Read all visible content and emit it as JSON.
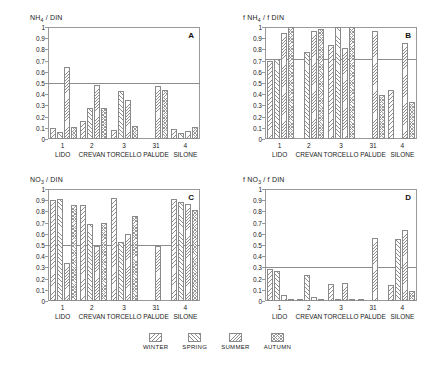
{
  "figure": {
    "width": 434,
    "height": 370,
    "background": "#ffffff",
    "line_color": "#8c8c8c"
  },
  "legend": {
    "position": "bottom-center",
    "items": [
      {
        "label": "WINTER",
        "pattern": "p-winter",
        "swatch_name": "winter-swatch"
      },
      {
        "label": "SPRING",
        "pattern": "p-spring",
        "swatch_name": "spring-swatch"
      },
      {
        "label": "SUMMER",
        "pattern": "p-summer",
        "swatch_name": "summer-swatch"
      },
      {
        "label": "AUTUMN",
        "pattern": "p-autumn",
        "swatch_name": "autumn-swatch"
      }
    ]
  },
  "stations": [
    {
      "num": "1",
      "name": "LIDO"
    },
    {
      "num": "2",
      "name": "CREVAN"
    },
    {
      "num": "3",
      "name": "TORCELLO"
    },
    {
      "num": "31",
      "name": "PALUDE"
    },
    {
      "num": "4",
      "name": "SILONE"
    }
  ],
  "yticks": [
    "1",
    "0.9",
    "0.8",
    "0.7",
    "0.6",
    "0.5",
    "0.4",
    "0.3",
    "0.2",
    "0.1",
    "0"
  ],
  "chart_data": [
    {
      "id": "A",
      "type": "bar",
      "title": "NH4 / DIN",
      "title_main": "NH",
      "title_sub": "4",
      "title_tail": " / DIN",
      "panel_letter": "A",
      "xlabel": "",
      "ylabel": "NH4 / DIN",
      "ylim": [
        0,
        1
      ],
      "ytick_step": 0.1,
      "grid": false,
      "threshold": 0.5,
      "categories": [
        "1 LIDO",
        "2 CREVAN",
        "3 TORCELLO",
        "31 PALUDE",
        "4 SILONE"
      ],
      "series": [
        {
          "name": "WINTER",
          "values": [
            0.1,
            0.16,
            0.08,
            null,
            0.09
          ]
        },
        {
          "name": "SPRING",
          "values": [
            0.06,
            0.28,
            0.43,
            null,
            0.05
          ]
        },
        {
          "name": "SUMMER",
          "values": [
            0.64,
            0.48,
            0.35,
            0.47,
            0.07
          ]
        },
        {
          "name": "AUTUMN",
          "values": [
            0.11,
            0.28,
            0.12,
            0.44,
            0.11
          ]
        }
      ]
    },
    {
      "id": "B",
      "type": "bar",
      "title": "f NH4 / f DIN",
      "title_main": "f NH",
      "title_sub": "4",
      "title_tail": " / f DIN",
      "panel_letter": "B",
      "xlabel": "",
      "ylabel": "f NH4 / f DIN",
      "ylim": [
        0,
        1
      ],
      "ytick_step": 0.1,
      "grid": false,
      "threshold": 0.71,
      "categories": [
        "1 LIDO",
        "2 CREVAN",
        "3 TORCELLO",
        "31 PALUDE",
        "4 SILONE"
      ],
      "series": [
        {
          "name": "WINTER",
          "values": [
            0.7,
            null,
            0.84,
            null,
            0.44
          ]
        },
        {
          "name": "SPRING",
          "values": [
            0.71,
            0.78,
            1.0,
            null,
            null
          ]
        },
        {
          "name": "SUMMER",
          "values": [
            0.95,
            0.96,
            0.81,
            0.96,
            0.86
          ]
        },
        {
          "name": "AUTUMN",
          "values": [
            1.0,
            0.98,
            1.0,
            0.39,
            0.33
          ]
        }
      ]
    },
    {
      "id": "C",
      "type": "bar",
      "title": "NO3 / DIN",
      "title_main": "NO",
      "title_sub": "3",
      "title_tail": " / DIN",
      "panel_letter": "C",
      "xlabel": "",
      "ylabel": "NO3 / DIN",
      "ylim": [
        0,
        1
      ],
      "ytick_step": 0.1,
      "grid": false,
      "threshold": 0.5,
      "categories": [
        "1 LIDO",
        "2 CREVAN",
        "3 TORCELLO",
        "31 PALUDE",
        "4 SILONE"
      ],
      "series": [
        {
          "name": "WINTER",
          "values": [
            0.9,
            0.86,
            0.92,
            null,
            0.91
          ]
        },
        {
          "name": "SPRING",
          "values": [
            0.91,
            0.69,
            0.53,
            null,
            0.88
          ]
        },
        {
          "name": "SUMMER",
          "values": [
            0.34,
            0.49,
            0.6,
            0.49,
            0.87
          ]
        },
        {
          "name": "AUTUMN",
          "values": [
            0.86,
            0.7,
            0.76,
            null,
            0.81
          ]
        }
      ]
    },
    {
      "id": "D",
      "type": "bar",
      "title": "f NO3 / f DIN",
      "title_main": "f NO",
      "title_sub": "3",
      "title_tail": " / f DIN",
      "panel_letter": "D",
      "xlabel": "",
      "ylabel": "f NO3 / f DIN",
      "ylim": [
        0,
        1
      ],
      "ytick_step": 0.1,
      "grid": false,
      "threshold": 0.3,
      "categories": [
        "1 LIDO",
        "2 CREVAN",
        "3 TORCELLO",
        "31 PALUDE",
        "4 SILONE"
      ],
      "series": [
        {
          "name": "WINTER",
          "values": [
            0.285,
            0.01,
            0.15,
            0.01,
            0.14
          ]
        },
        {
          "name": "SPRING",
          "values": [
            0.27,
            0.23,
            0.02,
            null,
            0.55
          ]
        },
        {
          "name": "SUMMER",
          "values": [
            0.05,
            0.035,
            0.16,
            0.565,
            0.63
          ]
        },
        {
          "name": "AUTUMN",
          "values": [
            0.012,
            0.015,
            0.01,
            null,
            0.09
          ]
        }
      ]
    }
  ]
}
